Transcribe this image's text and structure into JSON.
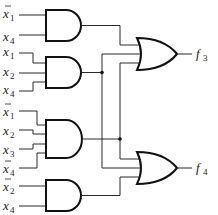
{
  "diagram": {
    "type": "logic-circuit",
    "gates": [
      {
        "id": "and1",
        "type": "AND",
        "inputs": [
          "x̄1",
          "x4"
        ]
      },
      {
        "id": "and2",
        "type": "AND",
        "inputs": [
          "x1",
          "x2",
          "x4"
        ]
      },
      {
        "id": "and3",
        "type": "AND",
        "inputs": [
          "x̄1",
          "x2",
          "x3",
          "x̄4"
        ]
      },
      {
        "id": "and4",
        "type": "AND",
        "inputs": [
          "x̄2",
          "x4"
        ]
      },
      {
        "id": "or1",
        "type": "OR",
        "inputs": [
          "and1",
          "and2",
          "and3"
        ],
        "output": "f3"
      },
      {
        "id": "or2",
        "type": "OR",
        "inputs": [
          "and3",
          "and2",
          "and4"
        ],
        "output": "f4"
      }
    ],
    "inputs": [
      {
        "var": "x",
        "sub": "1",
        "bar": true
      },
      {
        "var": "x",
        "sub": "4",
        "bar": false
      },
      {
        "var": "x",
        "sub": "1",
        "bar": false
      },
      {
        "var": "x",
        "sub": "2",
        "bar": false
      },
      {
        "var": "x",
        "sub": "4",
        "bar": false
      },
      {
        "var": "x",
        "sub": "1",
        "bar": true
      },
      {
        "var": "x",
        "sub": "2",
        "bar": false
      },
      {
        "var": "x",
        "sub": "3",
        "bar": false
      },
      {
        "var": "x",
        "sub": "4",
        "bar": true
      },
      {
        "var": "x",
        "sub": "2",
        "bar": true
      },
      {
        "var": "x",
        "sub": "4",
        "bar": false
      }
    ],
    "outputs": [
      {
        "var": "f",
        "sub": "3"
      },
      {
        "var": "f",
        "sub": "4"
      }
    ]
  }
}
